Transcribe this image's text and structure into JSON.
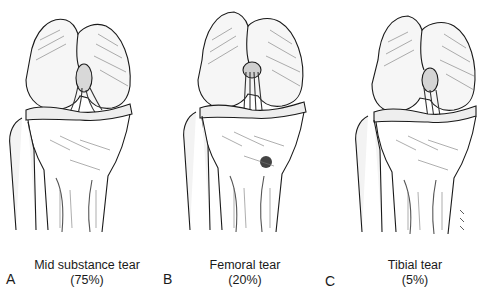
{
  "figure": {
    "panels": [
      {
        "letter": "A",
        "title": "Mid substance tear",
        "percent": "(75%)",
        "tear_location": "mid-substance"
      },
      {
        "letter": "B",
        "title": "Femoral tear",
        "percent": "(20%)",
        "tear_location": "femoral"
      },
      {
        "letter": "C",
        "title": "Tibial tear",
        "percent": "(5%)",
        "tear_location": "tibial"
      }
    ],
    "colors": {
      "ink": "#1a1a1a",
      "shade": "#555555",
      "background": "#ffffff"
    }
  }
}
